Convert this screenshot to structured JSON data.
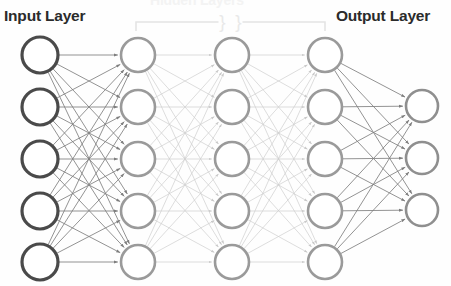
{
  "diagram": {
    "title_hidden_cropped": "Hidden Layers",
    "labels": {
      "input": "Input Layer",
      "output": "Output Layer"
    },
    "colors": {
      "background": "#fefefe",
      "input_node_stroke": "#4a4a4a",
      "hidden_node_stroke": "#9a9a9a",
      "output_node_stroke": "#8f8f8f",
      "edge_dark": "#808080",
      "edge_light": "#cfcfcf",
      "bracket": "#e4e4e4",
      "label_text": "#2b2b2b"
    },
    "bracket": {
      "name": "hidden-layers-bracket",
      "x_start": 136,
      "x_end": 325,
      "y": 22,
      "tick_height": 9,
      "break_symbol": "}",
      "break_count": 2
    },
    "layers": [
      {
        "id": "input",
        "name": "input-layer",
        "node_count": 5,
        "cx": 40,
        "r": 18,
        "stroke_width": 3.2,
        "stroke": "#4a4a4a",
        "cys": [
          55,
          107,
          159,
          211,
          262
        ]
      },
      {
        "id": "hidden-1",
        "name": "hidden-layer-1",
        "node_count": 5,
        "cx": 138,
        "r": 17,
        "stroke_width": 2.6,
        "stroke": "#9a9a9a",
        "cys": [
          55,
          107,
          159,
          211,
          262
        ]
      },
      {
        "id": "hidden-2",
        "name": "hidden-layer-2",
        "node_count": 5,
        "cx": 232,
        "r": 17,
        "stroke_width": 2.6,
        "stroke": "#9a9a9a",
        "cys": [
          55,
          107,
          159,
          211,
          262
        ]
      },
      {
        "id": "hidden-3",
        "name": "hidden-layer-3",
        "node_count": 5,
        "cx": 325,
        "r": 17,
        "stroke_width": 2.6,
        "stroke": "#9a9a9a",
        "cys": [
          55,
          107,
          159,
          211,
          262
        ]
      },
      {
        "id": "output",
        "name": "output-layer",
        "node_count": 3,
        "cx": 422,
        "r": 16,
        "stroke_width": 2.6,
        "stroke": "#8f8f8f",
        "cys": [
          106,
          158,
          210
        ]
      }
    ],
    "connections": [
      {
        "from": "input",
        "to": "hidden-1",
        "style": "dark",
        "fully_connected": true
      },
      {
        "from": "hidden-1",
        "to": "hidden-2",
        "style": "light",
        "fully_connected": true
      },
      {
        "from": "hidden-2",
        "to": "hidden-3",
        "style": "light",
        "fully_connected": true
      },
      {
        "from": "hidden-3",
        "to": "output",
        "style": "dark",
        "fully_connected": true
      }
    ]
  }
}
